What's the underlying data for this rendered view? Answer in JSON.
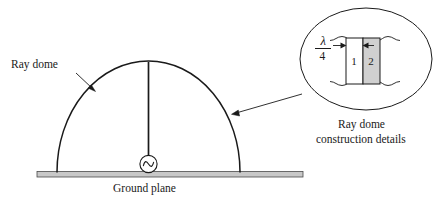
{
  "figure": {
    "type": "technical-diagram"
  },
  "labels": {
    "ray_dome": "Ray dome",
    "ground_plane": "Ground plane",
    "detail_caption_line1": "Ray dome",
    "detail_caption_line2": "construction details"
  },
  "detail_callout": {
    "dimension_numerator": "λ",
    "dimension_denominator": "4",
    "layer_1_label": "1",
    "layer_2_label": "2"
  },
  "components": {
    "antenna_icon": "monopole-antenna",
    "source_icon": "ac-source-sine"
  },
  "colors": {
    "line": "#1a1a1a",
    "ground_fill": "#c8c8c8",
    "layer2_fill": "#d0d0d0",
    "layer1_fill": "#ffffff",
    "background": "#ffffff"
  }
}
